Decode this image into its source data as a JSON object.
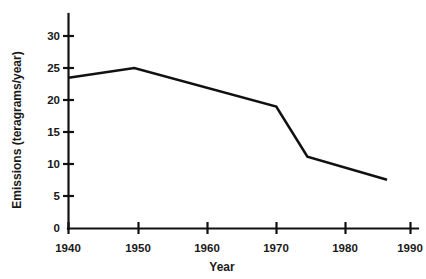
{
  "chart_data": {
    "type": "line",
    "title": "",
    "xlabel": "Year",
    "ylabel": "Emissions (teragrams/year)",
    "xlim": [
      1940,
      1990
    ],
    "ylim": [
      0,
      32
    ],
    "grid": false,
    "legend": null,
    "x_ticks": [
      1940,
      1950,
      1960,
      1970,
      1980,
      1990
    ],
    "x_tick_labels": [
      "1940",
      "1950",
      "1960",
      "1970",
      "1980",
      "1990"
    ],
    "y_ticks": [
      0,
      5,
      10,
      15,
      20,
      25,
      30
    ],
    "y_tick_labels": [
      "0",
      "5",
      "10",
      "15",
      "20",
      "25",
      "30"
    ],
    "series": [
      {
        "name": "Emissions",
        "color": "#111111",
        "x": [
          1940,
          1949.5,
          1970,
          1974.5,
          1986
        ],
        "values": [
          23.5,
          25.0,
          19.0,
          11.2,
          7.6
        ]
      }
    ]
  },
  "axis": {
    "x_title": "Year",
    "y_title": "Emissions (teragrams/year)"
  }
}
